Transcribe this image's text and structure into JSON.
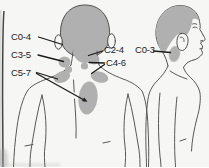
{
  "diagram": {
    "labels": [
      {
        "id": "c0-4",
        "text": "C0-4"
      },
      {
        "id": "c3-5",
        "text": "C3-5"
      },
      {
        "id": "c5-7",
        "text": "C5-7"
      },
      {
        "id": "c2-4",
        "text": "C2-4"
      },
      {
        "id": "c4-6",
        "text": "C4-6"
      },
      {
        "id": "c0-3",
        "text": "C0-3"
      }
    ]
  },
  "colors": {
    "background": "#f6f6f4",
    "shaded_region": "#b0b0b0",
    "outline": "#545454",
    "label_text": "#1c1c1c",
    "leader_line": "#1b1b1b",
    "page_edge": "#454545"
  }
}
